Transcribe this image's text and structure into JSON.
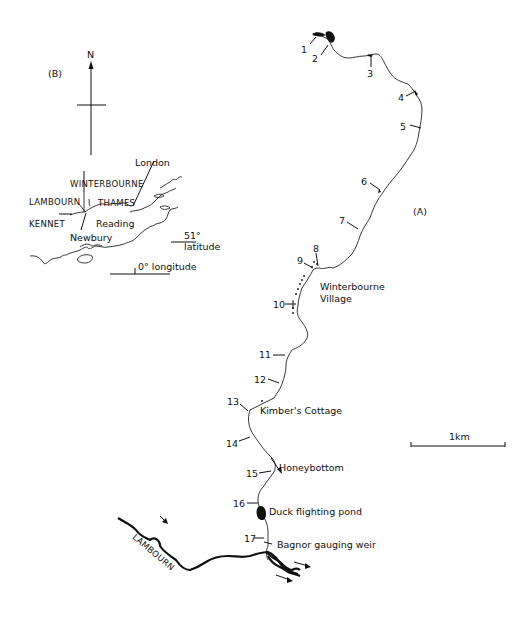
{
  "figure": {
    "panel_a_label": "(A)",
    "panel_b_label": "(B)"
  },
  "inset_map_b": {
    "north_arrow_label": "N",
    "labels": {
      "london": "London",
      "winterbourne": "WINTERBOURNE",
      "lambourn": "LAMBOURN",
      "thames": "THAMES",
      "kennet": "KENNET",
      "reading": "Reading",
      "newbury": "Newbury",
      "latitude_value": "51°",
      "latitude_word": "latitude",
      "longitude": "0° longitude"
    }
  },
  "main_map_a": {
    "scale_bar_label": "1km",
    "sampling_sites": [
      {
        "id": "1"
      },
      {
        "id": "2"
      },
      {
        "id": "3"
      },
      {
        "id": "4"
      },
      {
        "id": "5"
      },
      {
        "id": "6"
      },
      {
        "id": "7"
      },
      {
        "id": "8"
      },
      {
        "id": "9"
      },
      {
        "id": "10"
      },
      {
        "id": "11"
      },
      {
        "id": "12"
      },
      {
        "id": "13"
      },
      {
        "id": "14"
      },
      {
        "id": "15"
      },
      {
        "id": "16"
      },
      {
        "id": "17"
      }
    ],
    "place_labels": {
      "winterbourne_village_line1": "Winterbourne",
      "winterbourne_village_line2": "Village",
      "kimbers_cottage": "Kimber's Cottage",
      "honeybottom": "Honeybottom",
      "duck_flighting_pond": "Duck flighting pond",
      "bagnor_gauging_weir": "Bagnor gauging weir",
      "lambourn_river": "LAMBOURN"
    }
  }
}
